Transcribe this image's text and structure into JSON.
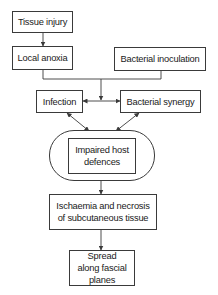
{
  "diagram": {
    "type": "flowchart",
    "nodes": {
      "tissue_injury": "Tissue injury",
      "local_anoxia": "Local anoxia",
      "bacterial_inoculation": "Bacterial inoculation",
      "infection": "Infection",
      "bacterial_synergy": "Bacterial synergy",
      "impaired_host_defences": "Impaired host defences",
      "ischaemia_necrosis": "Ischaemia and necrosis of subcutaneous tissue",
      "spread_fascial_planes": "Spread along fascial planes"
    },
    "edges": [
      {
        "from": "Tissue injury",
        "to": "Local anoxia",
        "type": "arrow"
      },
      {
        "from": "Local anoxia",
        "to": "junction",
        "type": "line"
      },
      {
        "from": "Bacterial inoculation",
        "to": "junction",
        "type": "line"
      },
      {
        "from": "junction",
        "to": "Infection/Bacterial synergy link",
        "type": "arrow"
      },
      {
        "from": "Infection",
        "to": "Bacterial synergy",
        "type": "double-arrow"
      },
      {
        "from": "Infection",
        "to": "Impaired host defences",
        "type": "double-arrow"
      },
      {
        "from": "Bacterial synergy",
        "to": "Impaired host defences",
        "type": "double-arrow"
      },
      {
        "from": "Impaired host defences",
        "to": "Ischaemia and necrosis of subcutaneous tissue",
        "type": "arrow"
      },
      {
        "from": "Ischaemia and necrosis of subcutaneous tissue",
        "to": "Spread along fascial planes",
        "type": "arrow"
      }
    ],
    "colors": {
      "stroke": "#3a3a3a",
      "text": "#1a1a1a",
      "background": "#ffffff"
    }
  }
}
